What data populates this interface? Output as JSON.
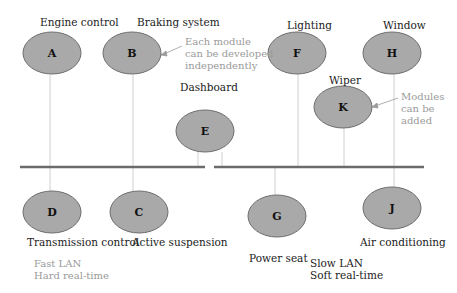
{
  "diagram": {
    "colors": {
      "node_fill": "#a9a9a9",
      "node_stroke": "#6e6e6e",
      "bus": "#6b6b6b",
      "connector": "#cfcfcf",
      "annotation_text": "#9a9a9a",
      "label_text": "#222222"
    },
    "nodes": [
      {
        "id": "A",
        "letter": "A",
        "label": "Engine control"
      },
      {
        "id": "B",
        "letter": "B",
        "label": "Braking  system"
      },
      {
        "id": "E",
        "letter": "E",
        "label": "Dashboard"
      },
      {
        "id": "F",
        "letter": "F",
        "label": "Lighting"
      },
      {
        "id": "H",
        "letter": "H",
        "label": "Window"
      },
      {
        "id": "K",
        "letter": "K",
        "label": "Wiper"
      },
      {
        "id": "D",
        "letter": "D",
        "label": "Transmission control"
      },
      {
        "id": "C",
        "letter": "C",
        "label": "Active suspension"
      },
      {
        "id": "G",
        "letter": "G",
        "label": "Power seat"
      },
      {
        "id": "J",
        "letter": "J",
        "label": "Air conditioning"
      }
    ],
    "annotations": {
      "independent": [
        "Each module",
        "can be developed",
        "independently"
      ],
      "added": [
        "Modules",
        "can be",
        "added"
      ]
    },
    "networks": {
      "fast": {
        "line1": "Fast LAN",
        "line2": "Hard real-time"
      },
      "slow": {
        "line1": "Slow LAN",
        "line2": "Soft real-time"
      }
    }
  }
}
